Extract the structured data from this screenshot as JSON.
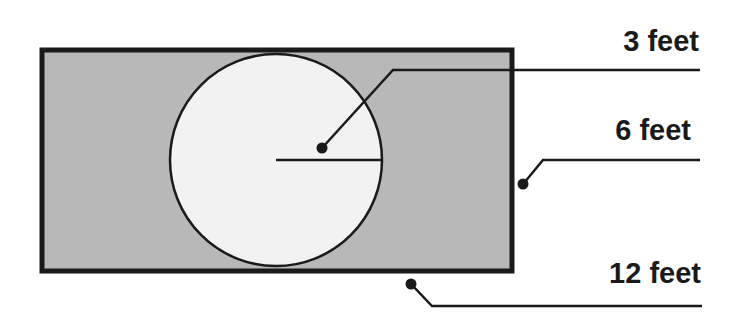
{
  "diagram": {
    "colors": {
      "shaded_region": "#b8b8b8",
      "circle_fill": "#f2f2f2",
      "stroke": "#1a1a1a",
      "background": "#ffffff"
    },
    "shapes": {
      "rectangle": {
        "x": 42,
        "y": 50,
        "width": 470,
        "height": 221
      },
      "circle": {
        "cx": 276,
        "cy": 160,
        "r": 106
      },
      "radius_line": {
        "x1": 276,
        "y1": 160,
        "x2": 382,
        "y2": 160
      }
    },
    "labels": [
      {
        "id": "radius",
        "text": "3 feet",
        "describes": "circle radius"
      },
      {
        "id": "width",
        "text": "6 feet",
        "describes": "rectangle width"
      },
      {
        "id": "length",
        "text": "12 feet",
        "describes": "rectangle length"
      }
    ]
  }
}
